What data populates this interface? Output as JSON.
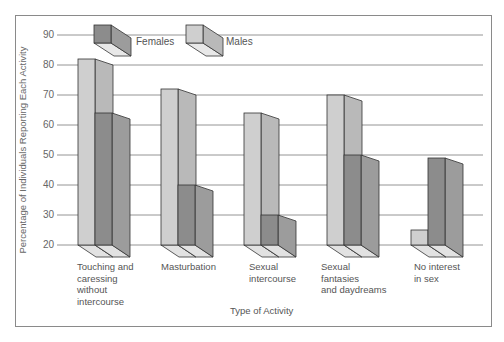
{
  "chart_data": {
    "type": "bar",
    "style": "3d-grouped",
    "title": "",
    "xlabel": "Type of Activity",
    "ylabel": "Percentage of Individuals Reporting Each Activity",
    "ylim": [
      20,
      90
    ],
    "yticks": [
      20,
      30,
      40,
      50,
      60,
      70,
      80,
      90
    ],
    "grid": true,
    "legend_position": "top",
    "categories": [
      "Touching and\ncaressing\nwithout\nintercourse",
      "Masturbation",
      "Sexual\nintercourse",
      "Sexual\nfantasies\nand daydreams",
      "No interest\nin sex"
    ],
    "series": [
      {
        "name": "Males",
        "color": "#cfcfcf",
        "values": [
          82,
          72,
          64,
          70,
          25
        ]
      },
      {
        "name": "Females",
        "color": "#8c8c8c",
        "values": [
          64,
          40,
          30,
          50,
          49
        ]
      }
    ]
  },
  "legend": {
    "females": "Females",
    "males": "Males"
  },
  "axis": {
    "ylabel": "Percentage of Individuals Reporting Each Activity",
    "xlabel": "Type of Activity",
    "ticks": [
      "90",
      "80",
      "70",
      "60",
      "50",
      "40",
      "30",
      "20"
    ]
  },
  "categories": [
    "Touching and\ncaressing\nwithout\nintercourse",
    "Masturbation",
    "Sexual\nintercourse",
    "Sexual\nfantasies\nand daydreams",
    "No interest\nin sex"
  ],
  "colors": {
    "male_front": "#cfcfcf",
    "male_side": "#b9b9b9",
    "male_top": "#e4e4e4",
    "female_front": "#8c8c8c",
    "female_side": "#9c9c9c",
    "female_top": "#7a7a7a",
    "base": "#e2e2e2",
    "grid": "#888888",
    "outline": "#333333"
  }
}
